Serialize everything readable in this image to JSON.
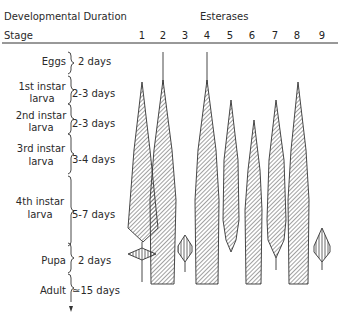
{
  "header": {
    "left_title": "Developmental Duration",
    "stage_label": "Stage",
    "right_title": "Esterases"
  },
  "columns": [
    "1",
    "2",
    "3",
    "4",
    "5",
    "6",
    "7",
    "8",
    "9"
  ],
  "stages": [
    {
      "line1": "Eggs",
      "line2": "",
      "duration": "2 days"
    },
    {
      "line1": "1st instar",
      "line2": "larva",
      "duration": "2-3 days"
    },
    {
      "line1": "2nd instar",
      "line2": "larva",
      "duration": "2-3 days"
    },
    {
      "line1": "3rd instar",
      "line2": "larva",
      "duration": "3-4 days"
    },
    {
      "line1": "4th instar",
      "line2": "larva",
      "duration": "5-7 days"
    },
    {
      "line1": "Pupa",
      "line2": "",
      "duration": "2 days"
    },
    {
      "line1": "Adult",
      "line2": "",
      "duration": "≃15 days"
    }
  ],
  "colors": {
    "ink": "#2a2a2a",
    "hatch": "#444444",
    "background": "#ffffff"
  }
}
